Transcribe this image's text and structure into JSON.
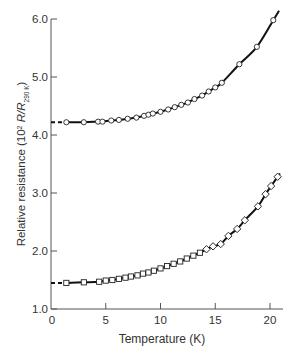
{
  "chart_data": {
    "type": "line",
    "title": "",
    "xlabel": "Temperature (K)",
    "ylabel": {
      "prefix": "Relative resistance (10",
      "sup": "2",
      "mid": " R/R",
      "sub": "290 K",
      "suffix": ")"
    },
    "xlim": [
      0,
      21
    ],
    "ylim": [
      1.0,
      6.0
    ],
    "x_ticks": [
      0,
      5,
      10,
      15,
      20
    ],
    "x_tick_labels": [
      "0",
      "5",
      "10",
      "15",
      "20"
    ],
    "y_ticks": [
      1.0,
      2.0,
      3.0,
      4.0,
      5.0,
      6.0
    ],
    "y_tick_labels": [
      "1.0",
      "2.0",
      "3.0",
      "4.0",
      "5.0",
      "6.0"
    ],
    "grid": false,
    "legend": null,
    "series": [
      {
        "name": "upper sample (circles)",
        "marker": "circle",
        "extrapolation_start": {
          "x": 0,
          "y": 4.22
        },
        "x": [
          1.4,
          3.0,
          4.3,
          4.7,
          5.5,
          6.2,
          7.0,
          7.8,
          8.5,
          8.9,
          9.3,
          10.0,
          10.7,
          11.3,
          11.9,
          12.5,
          13.1,
          13.8,
          14.4,
          15.0,
          15.6,
          17.2,
          18.8,
          20.3
        ],
        "y": [
          4.22,
          4.22,
          4.23,
          4.23,
          4.25,
          4.26,
          4.28,
          4.3,
          4.33,
          4.35,
          4.37,
          4.4,
          4.44,
          4.48,
          4.52,
          4.56,
          4.62,
          4.68,
          4.75,
          4.82,
          4.9,
          5.22,
          5.52,
          5.98
        ]
      },
      {
        "name": "lower sample (squares)",
        "marker": "square",
        "extrapolation_start": {
          "x": 0,
          "y": 1.45
        },
        "x": [
          1.4,
          3.0,
          4.4,
          5.0,
          5.6,
          6.2,
          6.8,
          7.3,
          7.9,
          8.4,
          8.9,
          9.4,
          10.0,
          10.6,
          11.2,
          11.8,
          12.4,
          13.0,
          13.6,
          14.2,
          14.8,
          15.5,
          16.2,
          17.0,
          17.7,
          18.9,
          19.6,
          20.1,
          20.7
        ],
        "y": [
          1.45,
          1.46,
          1.47,
          1.49,
          1.5,
          1.52,
          1.54,
          1.56,
          1.58,
          1.61,
          1.63,
          1.66,
          1.7,
          1.74,
          1.78,
          1.82,
          1.87,
          1.92,
          1.97,
          2.03,
          2.08,
          2.12,
          2.26,
          2.38,
          2.53,
          2.77,
          2.98,
          3.12,
          3.28
        ]
      }
    ]
  }
}
